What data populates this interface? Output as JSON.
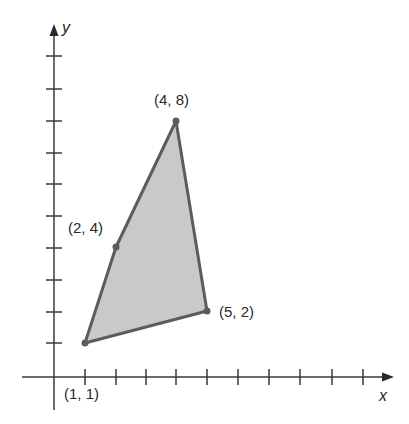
{
  "figure": {
    "axes": {
      "x_label": "x",
      "y_label": "y",
      "x_ticks": 10,
      "y_ticks": 9
    },
    "polygon": {
      "fill": "#c8c8c8",
      "stroke": "#5a5a5a",
      "vertices": [
        {
          "x": 1,
          "y": 1,
          "label": "(1, 1)"
        },
        {
          "x": 2,
          "y": 4,
          "label": "(2, 4)"
        },
        {
          "x": 4,
          "y": 8,
          "label": "(4, 8)"
        },
        {
          "x": 5,
          "y": 2,
          "label": "(5, 2)"
        }
      ]
    }
  }
}
